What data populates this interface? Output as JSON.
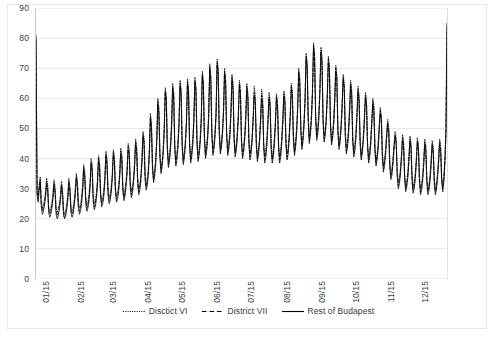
{
  "chart_data": {
    "type": "line",
    "title": "",
    "subtitle": "",
    "xlabel": "",
    "ylabel": "",
    "ylim": [
      0,
      90
    ],
    "ytick_step": 10,
    "yticks": [
      "0",
      "10",
      "20",
      "30",
      "40",
      "50",
      "60",
      "70",
      "80",
      "90"
    ],
    "xticks": [
      "01/15",
      "02/15",
      "03/15",
      "04/15",
      "05/15",
      "06/15",
      "07/15",
      "08/15",
      "09/15",
      "10/15",
      "11/15",
      "12/15"
    ],
    "grid": "horizontal",
    "legend_position": "bottom",
    "x_unit": "day",
    "x_count": 365,
    "series": [
      {
        "name": "Disctict VI",
        "style": "dotted",
        "color": "#000000",
        "values": [
          79.5,
          30.0,
          27.5,
          31.5,
          34.0,
          26.0,
          23.5,
          24.5,
          26.5,
          29.0,
          33.5,
          31.5,
          24.0,
          22.5,
          23.5,
          25.5,
          28.5,
          33.0,
          30.5,
          23.5,
          22.0,
          23.0,
          25.0,
          27.5,
          32.5,
          30.0,
          23.0,
          21.5,
          22.5,
          25.0,
          28.0,
          33.5,
          31.0,
          24.0,
          22.5,
          23.5,
          26.0,
          29.5,
          35.0,
          33.0,
          25.5,
          23.5,
          24.5,
          27.0,
          31.0,
          38.0,
          36.0,
          27.0,
          24.5,
          25.5,
          28.0,
          32.0,
          40.0,
          38.0,
          28.0,
          25.0,
          26.0,
          28.5,
          33.0,
          41.0,
          39.0,
          29.0,
          26.0,
          27.0,
          29.5,
          34.0,
          42.5,
          40.0,
          30.0,
          27.0,
          28.0,
          30.5,
          35.0,
          43.0,
          41.0,
          30.5,
          27.5,
          28.5,
          31.0,
          35.5,
          43.5,
          41.5,
          31.0,
          28.0,
          29.5,
          32.5,
          37.0,
          45.0,
          43.0,
          32.5,
          29.0,
          30.5,
          33.5,
          38.5,
          46.5,
          44.5,
          33.5,
          30.0,
          31.5,
          34.5,
          40.0,
          49.0,
          47.0,
          35.0,
          31.5,
          33.0,
          36.5,
          43.0,
          55.0,
          52.0,
          38.0,
          34.0,
          36.0,
          40.0,
          47.0,
          60.0,
          57.0,
          42.0,
          37.0,
          39.0,
          43.0,
          50.0,
          63.5,
          61.0,
          44.5,
          39.0,
          41.0,
          45.0,
          52.0,
          65.0,
          62.0,
          45.0,
          39.5,
          41.5,
          45.5,
          52.5,
          66.0,
          63.0,
          45.5,
          40.0,
          42.0,
          46.0,
          53.0,
          66.5,
          63.5,
          46.0,
          40.5,
          42.5,
          46.5,
          53.5,
          67.0,
          64.0,
          46.5,
          41.0,
          43.0,
          47.0,
          54.0,
          69.0,
          66.0,
          48.0,
          42.0,
          44.0,
          48.0,
          55.0,
          71.5,
          68.0,
          49.5,
          43.0,
          45.0,
          49.0,
          56.0,
          73.0,
          70.0,
          50.0,
          43.5,
          45.5,
          49.5,
          56.5,
          70.0,
          67.0,
          49.0,
          43.0,
          45.0,
          49.0,
          56.0,
          68.0,
          65.0,
          48.0,
          42.5,
          44.5,
          48.5,
          55.0,
          66.0,
          63.0,
          47.0,
          42.0,
          44.0,
          48.0,
          54.5,
          65.0,
          62.0,
          46.5,
          41.5,
          43.5,
          47.5,
          54.0,
          64.0,
          61.0,
          46.0,
          41.0,
          43.0,
          47.0,
          53.5,
          63.0,
          60.0,
          45.5,
          41.0,
          43.0,
          47.0,
          53.5,
          62.0,
          59.5,
          45.0,
          40.5,
          42.5,
          46.5,
          53.0,
          61.5,
          59.0,
          45.0,
          40.5,
          42.5,
          47.0,
          53.5,
          62.5,
          60.0,
          46.0,
          41.5,
          43.5,
          48.0,
          55.0,
          65.0,
          62.5,
          48.0,
          43.0,
          45.5,
          50.0,
          57.5,
          70.0,
          67.0,
          51.0,
          45.0,
          47.5,
          52.5,
          60.5,
          75.0,
          72.0,
          54.0,
          47.0,
          49.5,
          54.5,
          63.0,
          78.5,
          75.0,
          55.0,
          48.0,
          50.0,
          55.0,
          63.5,
          77.0,
          73.5,
          54.0,
          47.5,
          49.5,
          54.0,
          62.0,
          74.0,
          71.0,
          52.5,
          46.5,
          48.5,
          53.0,
          60.5,
          71.0,
          68.0,
          50.5,
          45.0,
          47.0,
          51.5,
          58.5,
          68.0,
          65.0,
          49.0,
          43.5,
          45.5,
          50.0,
          57.0,
          66.0,
          63.0,
          47.5,
          42.5,
          44.5,
          48.5,
          55.5,
          64.0,
          61.0,
          46.5,
          41.5,
          43.5,
          47.5,
          54.0,
          62.0,
          59.5,
          45.5,
          40.5,
          42.5,
          46.5,
          53.0,
          60.0,
          57.5,
          44.0,
          39.5,
          41.5,
          45.0,
          51.0,
          57.0,
          54.5,
          42.0,
          37.5,
          39.5,
          43.0,
          48.5,
          53.0,
          50.5,
          39.0,
          35.0,
          36.5,
          40.0,
          45.0,
          49.0,
          47.0,
          36.0,
          32.0,
          33.5,
          36.5,
          41.5,
          48.0,
          46.0,
          35.0,
          31.0,
          32.5,
          35.5,
          40.5,
          47.5,
          45.5,
          34.5,
          30.5,
          32.0,
          35.0,
          40.0,
          47.0,
          45.0,
          34.0,
          30.0,
          31.5,
          34.5,
          39.5,
          46.5,
          44.5,
          33.5,
          30.0,
          31.5,
          34.5,
          39.5,
          46.0,
          44.0,
          33.5,
          30.0,
          31.5,
          35.0,
          40.0,
          46.5,
          44.5,
          34.0,
          31.0,
          34.0,
          40.0,
          50.0,
          84.5
        ]
      },
      {
        "name": "District VII",
        "style": "dashed",
        "color": "#000000",
        "values": [
          81.0,
          29.0,
          26.5,
          30.5,
          33.0,
          25.0,
          22.5,
          23.5,
          25.5,
          28.0,
          32.5,
          30.5,
          23.0,
          21.5,
          22.5,
          24.5,
          27.5,
          32.0,
          29.5,
          22.5,
          21.0,
          22.0,
          24.0,
          26.5,
          31.5,
          29.0,
          22.0,
          20.5,
          21.5,
          24.0,
          27.0,
          32.5,
          30.0,
          23.0,
          21.5,
          22.5,
          25.0,
          28.5,
          34.0,
          32.0,
          24.5,
          22.5,
          23.5,
          26.0,
          30.0,
          37.0,
          35.0,
          26.0,
          23.5,
          24.5,
          27.0,
          31.0,
          39.0,
          37.0,
          27.0,
          24.0,
          25.0,
          27.5,
          32.0,
          40.0,
          38.0,
          28.0,
          25.0,
          26.0,
          28.5,
          33.0,
          41.5,
          39.0,
          29.0,
          26.0,
          27.0,
          29.5,
          34.0,
          42.0,
          40.0,
          29.5,
          26.5,
          27.5,
          30.0,
          34.5,
          42.5,
          40.5,
          30.0,
          27.0,
          28.5,
          31.5,
          36.0,
          44.0,
          42.0,
          31.5,
          28.0,
          29.5,
          32.5,
          37.5,
          45.5,
          43.5,
          32.5,
          29.0,
          30.5,
          33.5,
          39.0,
          48.0,
          46.0,
          34.0,
          30.5,
          32.0,
          35.5,
          42.0,
          54.0,
          51.0,
          37.0,
          33.0,
          35.0,
          39.0,
          46.0,
          59.0,
          56.0,
          41.0,
          36.0,
          38.0,
          42.0,
          49.0,
          62.5,
          60.0,
          43.5,
          38.0,
          40.0,
          44.0,
          51.0,
          64.0,
          61.0,
          44.0,
          38.5,
          40.5,
          44.5,
          51.5,
          65.0,
          62.0,
          44.5,
          39.0,
          41.0,
          45.0,
          52.0,
          65.5,
          62.5,
          45.0,
          39.5,
          41.5,
          45.5,
          52.5,
          66.0,
          63.0,
          45.5,
          40.0,
          42.0,
          46.0,
          53.0,
          68.0,
          65.0,
          47.0,
          41.0,
          43.0,
          47.0,
          54.0,
          70.5,
          67.0,
          48.5,
          42.0,
          44.0,
          48.0,
          55.0,
          72.0,
          69.0,
          49.0,
          42.5,
          44.5,
          48.5,
          55.5,
          69.0,
          66.0,
          48.0,
          42.0,
          44.0,
          48.0,
          55.0,
          67.0,
          64.0,
          47.0,
          41.5,
          43.5,
          47.5,
          54.0,
          65.0,
          62.0,
          46.0,
          41.0,
          43.0,
          47.0,
          53.5,
          64.0,
          61.0,
          45.5,
          40.5,
          42.5,
          46.5,
          53.0,
          62.0,
          59.0,
          45.0,
          40.0,
          42.0,
          46.0,
          52.5,
          61.0,
          58.5,
          44.0,
          39.5,
          41.5,
          45.5,
          52.5,
          60.5,
          58.0,
          44.0,
          39.5,
          41.5,
          45.5,
          52.0,
          60.5,
          58.0,
          44.0,
          39.5,
          41.5,
          46.0,
          52.5,
          61.5,
          59.0,
          45.0,
          40.5,
          42.5,
          47.0,
          54.0,
          64.0,
          61.5,
          47.0,
          42.0,
          44.5,
          49.0,
          56.5,
          69.0,
          66.0,
          50.0,
          44.0,
          46.5,
          51.5,
          59.5,
          74.0,
          71.0,
          53.0,
          46.0,
          48.5,
          53.5,
          62.0,
          77.5,
          74.0,
          54.0,
          47.0,
          49.0,
          54.0,
          62.5,
          76.0,
          72.5,
          53.0,
          46.5,
          48.5,
          53.0,
          61.0,
          73.0,
          70.0,
          51.5,
          45.5,
          47.5,
          52.0,
          59.5,
          70.0,
          67.0,
          49.5,
          44.0,
          46.0,
          50.5,
          57.5,
          67.0,
          64.0,
          48.0,
          42.5,
          44.5,
          48.5,
          55.5,
          65.0,
          62.0,
          46.5,
          41.5,
          43.5,
          47.5,
          54.5,
          63.0,
          60.0,
          45.5,
          40.5,
          42.5,
          46.5,
          53.0,
          61.0,
          58.5,
          44.5,
          39.5,
          41.5,
          45.5,
          52.0,
          59.0,
          56.5,
          43.0,
          38.5,
          40.5,
          44.0,
          50.0,
          56.0,
          53.5,
          41.0,
          36.5,
          38.5,
          42.0,
          47.5,
          52.0,
          49.5,
          38.0,
          34.0,
          35.5,
          39.0,
          44.0,
          48.0,
          46.0,
          35.0,
          31.0,
          32.5,
          35.5,
          40.5,
          47.0,
          45.0,
          34.0,
          30.0,
          31.5,
          34.5,
          39.5,
          46.5,
          44.5,
          33.5,
          29.5,
          31.0,
          34.0,
          39.0,
          46.0,
          44.0,
          33.0,
          29.0,
          30.5,
          33.5,
          38.5,
          45.5,
          43.5,
          32.5,
          29.0,
          30.5,
          33.5,
          38.5,
          45.0,
          43.0,
          32.5,
          29.0,
          30.5,
          34.0,
          39.0,
          45.5,
          43.5,
          33.0,
          30.0,
          33.0,
          39.0,
          49.0,
          83.0
        ]
      },
      {
        "name": "Rest of Budapest",
        "style": "solid",
        "color": "#000000",
        "values": [
          80.0,
          28.0,
          25.5,
          29.5,
          32.0,
          24.0,
          21.5,
          22.5,
          24.5,
          27.0,
          31.5,
          29.5,
          22.0,
          20.5,
          21.5,
          23.5,
          26.5,
          31.0,
          28.5,
          21.5,
          20.0,
          21.0,
          23.0,
          25.5,
          30.5,
          28.0,
          21.0,
          20.0,
          21.0,
          23.0,
          26.0,
          31.5,
          29.0,
          22.0,
          20.5,
          21.5,
          24.0,
          27.5,
          33.0,
          31.0,
          23.5,
          21.5,
          22.5,
          25.0,
          29.0,
          36.0,
          34.0,
          25.0,
          22.5,
          23.5,
          26.0,
          30.0,
          38.0,
          36.0,
          26.0,
          23.0,
          24.0,
          26.5,
          31.0,
          39.0,
          37.0,
          27.0,
          24.0,
          25.0,
          27.5,
          32.0,
          40.5,
          38.0,
          28.0,
          25.0,
          26.0,
          28.5,
          33.0,
          41.0,
          39.0,
          28.5,
          25.5,
          26.5,
          29.0,
          33.5,
          41.5,
          39.5,
          29.0,
          26.0,
          27.5,
          30.5,
          35.0,
          43.0,
          41.0,
          30.5,
          27.0,
          28.5,
          31.5,
          36.5,
          44.5,
          42.5,
          31.5,
          28.0,
          29.5,
          32.5,
          38.0,
          47.0,
          45.0,
          33.0,
          29.5,
          31.0,
          34.5,
          41.0,
          53.0,
          50.0,
          36.0,
          32.0,
          34.0,
          38.0,
          45.0,
          58.0,
          55.0,
          40.0,
          35.0,
          37.0,
          41.0,
          48.0,
          61.5,
          59.0,
          42.5,
          37.0,
          39.0,
          43.0,
          50.0,
          63.0,
          60.0,
          43.0,
          37.5,
          39.5,
          43.5,
          50.5,
          64.0,
          61.0,
          43.5,
          38.0,
          40.0,
          44.0,
          51.0,
          64.5,
          61.5,
          44.0,
          38.5,
          40.5,
          44.5,
          51.5,
          65.0,
          62.0,
          44.5,
          39.0,
          41.0,
          45.0,
          52.0,
          67.0,
          64.0,
          46.0,
          40.0,
          42.0,
          46.0,
          53.0,
          69.5,
          66.0,
          47.5,
          41.0,
          43.0,
          47.0,
          54.0,
          71.0,
          68.0,
          48.0,
          41.5,
          43.5,
          47.5,
          54.5,
          68.0,
          65.0,
          47.0,
          41.0,
          43.0,
          47.0,
          54.0,
          66.0,
          63.0,
          46.0,
          40.5,
          42.5,
          46.5,
          53.0,
          64.0,
          61.0,
          45.0,
          40.0,
          42.0,
          46.0,
          52.5,
          63.0,
          60.0,
          44.5,
          39.5,
          41.5,
          45.5,
          52.5,
          61.0,
          58.0,
          44.0,
          39.0,
          41.0,
          45.0,
          51.5,
          60.0,
          57.5,
          43.0,
          38.5,
          40.5,
          44.5,
          51.5,
          59.5,
          57.0,
          43.0,
          38.5,
          40.5,
          44.5,
          51.0,
          59.5,
          57.0,
          43.0,
          38.5,
          40.5,
          45.0,
          51.5,
          60.5,
          58.0,
          44.0,
          39.5,
          41.5,
          46.0,
          53.0,
          63.0,
          60.5,
          46.0,
          41.0,
          43.5,
          48.0,
          55.5,
          68.0,
          65.0,
          49.0,
          43.0,
          45.5,
          50.5,
          58.5,
          73.0,
          70.0,
          52.0,
          45.0,
          47.5,
          52.5,
          61.0,
          76.5,
          73.0,
          53.0,
          46.0,
          48.0,
          53.0,
          61.5,
          75.0,
          71.5,
          52.0,
          45.5,
          47.5,
          52.0,
          60.0,
          72.0,
          69.0,
          50.5,
          44.5,
          46.5,
          51.0,
          58.5,
          69.0,
          66.0,
          48.5,
          43.0,
          45.0,
          49.5,
          56.5,
          66.0,
          63.0,
          47.0,
          41.5,
          43.5,
          47.5,
          54.5,
          64.0,
          61.0,
          45.5,
          40.5,
          42.5,
          46.5,
          53.5,
          62.0,
          59.0,
          44.5,
          39.5,
          41.5,
          45.5,
          52.0,
          60.0,
          57.5,
          43.5,
          38.5,
          40.5,
          44.5,
          51.0,
          58.0,
          55.5,
          42.0,
          37.5,
          39.5,
          43.0,
          49.0,
          55.0,
          52.5,
          40.0,
          35.5,
          37.5,
          41.0,
          46.5,
          51.0,
          48.5,
          37.0,
          33.0,
          34.5,
          38.0,
          43.0,
          47.0,
          45.0,
          34.0,
          30.0,
          31.5,
          34.5,
          39.5,
          46.0,
          44.0,
          33.0,
          29.0,
          30.5,
          33.5,
          38.5,
          45.5,
          43.5,
          32.5,
          28.5,
          30.0,
          33.0,
          38.0,
          45.0,
          43.0,
          32.0,
          28.0,
          29.5,
          32.5,
          37.5,
          44.5,
          42.5,
          31.5,
          28.0,
          29.5,
          32.5,
          37.5,
          44.0,
          42.0,
          31.5,
          28.0,
          29.5,
          33.0,
          38.0,
          44.5,
          42.5,
          32.0,
          29.0,
          32.0,
          38.0,
          48.0,
          85.0
        ]
      }
    ]
  },
  "legend": {
    "items": [
      {
        "label": "Disctict VI",
        "style": "dotted"
      },
      {
        "label": "District VII",
        "style": "dashed"
      },
      {
        "label": "Rest of Budapest",
        "style": "solid"
      }
    ]
  }
}
